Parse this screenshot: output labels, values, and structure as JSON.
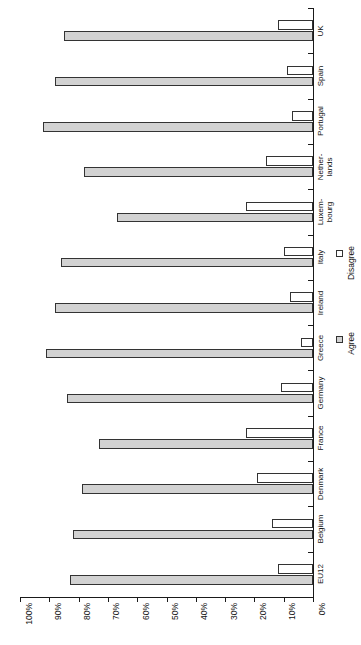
{
  "chart_data": {
    "type": "bar",
    "title": "",
    "subtitle": "",
    "xlabel": "",
    "ylabel": "",
    "orientation": "horizontal-rotated",
    "grid": false,
    "legend_position": "right",
    "axis": {
      "min": 0,
      "max": 100,
      "step": 10,
      "tick_labels": [
        "100%",
        "90%",
        "80%",
        "70%",
        "60%",
        "50%",
        "40%",
        "30%",
        "20%",
        "10%",
        "0%"
      ],
      "tick_values": [
        100,
        90,
        80,
        70,
        60,
        50,
        40,
        30,
        20,
        10,
        0
      ]
    },
    "categories": [
      "EU12",
      "Belgium",
      "Denmark",
      "France",
      "Germany",
      "Greece",
      "Ireland",
      "Italy",
      "Luxem-\nbourg",
      "Nether-\nlands",
      "Portugal",
      "Spain",
      "UK"
    ],
    "category_labels": [
      {
        "text": "EU12",
        "lines": [
          "EU12"
        ]
      },
      {
        "text": "Belgium",
        "lines": [
          "Belgium"
        ]
      },
      {
        "text": "Denmark",
        "lines": [
          "Denmark"
        ]
      },
      {
        "text": "France",
        "lines": [
          "France"
        ]
      },
      {
        "text": "Germany",
        "lines": [
          "Germany"
        ]
      },
      {
        "text": "Greece",
        "lines": [
          "Greece"
        ]
      },
      {
        "text": "Ireland",
        "lines": [
          "Ireland"
        ]
      },
      {
        "text": "Italy",
        "lines": [
          "Italy"
        ]
      },
      {
        "text": "Luxem-bourg",
        "lines": [
          "Luxem-",
          "bourg"
        ]
      },
      {
        "text": "Nether-lands",
        "lines": [
          "Nether-",
          "lands"
        ]
      },
      {
        "text": "Portugal",
        "lines": [
          "Portugal"
        ]
      },
      {
        "text": "Spain",
        "lines": [
          "Spain"
        ]
      },
      {
        "text": "UK",
        "lines": [
          "UK"
        ]
      }
    ],
    "series": [
      {
        "name": "Agree",
        "color": "#d2d2d2",
        "values": [
          83,
          82,
          79,
          73,
          84,
          91,
          88,
          86,
          67,
          78,
          92,
          88,
          85
        ]
      },
      {
        "name": "Disagree",
        "color": "#ffffff",
        "values": [
          12,
          14,
          19,
          23,
          11,
          4,
          8,
          10,
          23,
          16,
          7,
          9,
          12
        ]
      }
    ],
    "legend": [
      {
        "label": "Disagree",
        "swatch": "disagree"
      },
      {
        "label": "Agree",
        "swatch": "agree"
      }
    ]
  }
}
